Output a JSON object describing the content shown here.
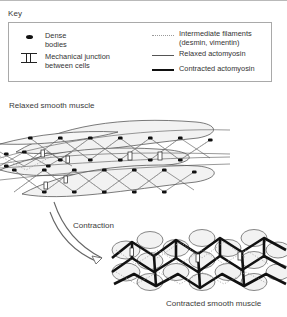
{
  "figure": {
    "key_title": "Key",
    "legend": {
      "left_items": [
        {
          "icon": "dense-body-icon",
          "label": "Dense\nbodies"
        },
        {
          "icon": "mechanical-junction-icon",
          "label": "Mechanical junction\nbetween cells"
        }
      ],
      "right_items": [
        {
          "icon": "dotted-line-icon",
          "label": "Intermediate filaments\n(desmin, vimentin)"
        },
        {
          "icon": "thin-line-icon",
          "label": "Relaxed actomyosin"
        },
        {
          "icon": "thick-line-icon",
          "label": "Contracted actomyosin"
        }
      ]
    },
    "labels": {
      "relaxed": "Relaxed smooth muscle",
      "contraction": "Contraction",
      "contracted": "Contracted smooth muscle"
    },
    "colors": {
      "line": "#333333",
      "dense_body": "#111111",
      "contracted_actomyosin": "#111111",
      "intermediate_filament": "#9a9a9a",
      "cell_fill": "#f2f2f2",
      "text": "#333333",
      "border": "#a9a9a9"
    }
  }
}
